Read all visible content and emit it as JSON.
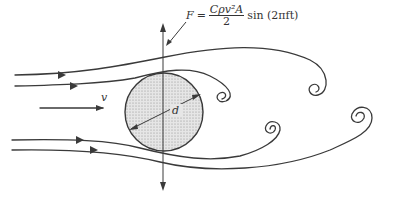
{
  "figure": {
    "type": "flow-around-cylinder-vortex-shedding",
    "equation": {
      "lhs": "F",
      "equals": "=",
      "numerator": "Cρv²A",
      "denominator": "2",
      "tail": "sin (2πft)"
    },
    "labels": {
      "velocity": "v",
      "diameter": "d",
      "force_leader": "F"
    },
    "colors": {
      "line": "#3a3a3a",
      "cylinder_fill": "#d9d9d9",
      "background": "#ffffff"
    }
  }
}
